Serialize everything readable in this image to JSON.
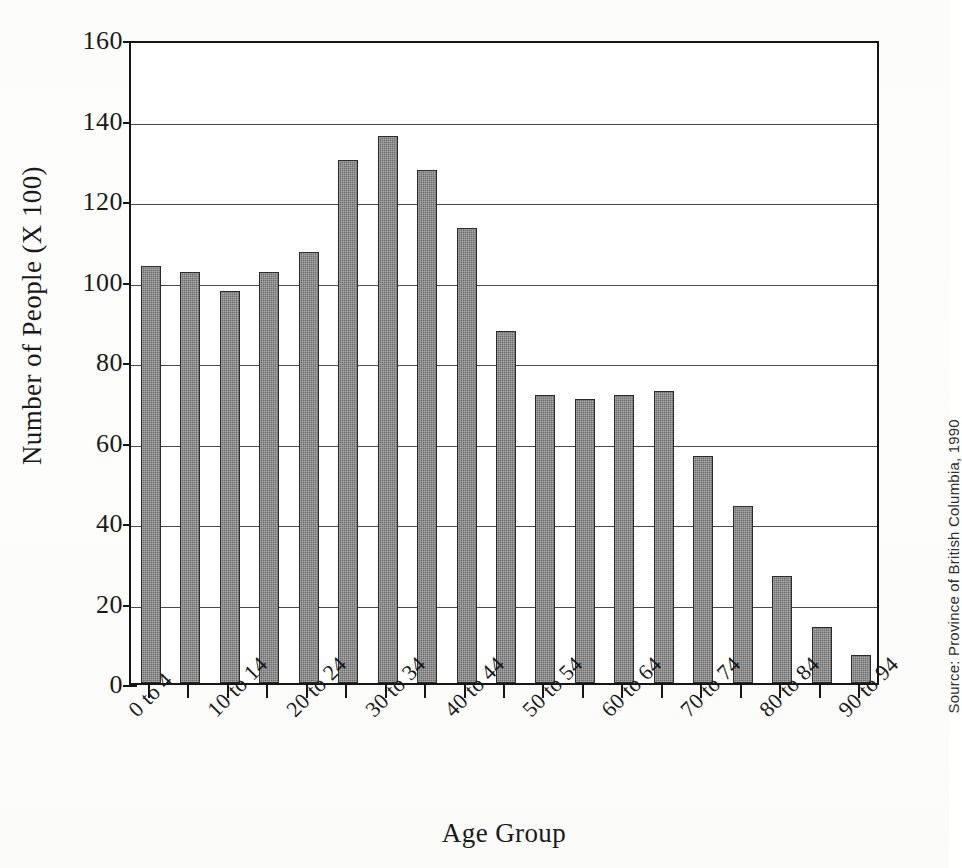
{
  "chart_data": {
    "type": "bar",
    "title": "",
    "xlabel": "Age Group",
    "ylabel": "Number of People (X 100)",
    "ylim": [
      0,
      160
    ],
    "yticks": [
      0,
      20,
      40,
      60,
      80,
      100,
      120,
      140,
      160
    ],
    "ytick_labels": [
      "0",
      "20",
      "40",
      "60",
      "80",
      "100",
      "120",
      "140",
      "160"
    ],
    "grid": true,
    "legend": "none",
    "bar_color": "#6e6e6e",
    "bar_edge_color": "#2b2b2b",
    "axis_color": "#151515",
    "categories": [
      "0 to 4",
      "5 to 9",
      "10 to 14",
      "15 to 19",
      "20 to 24",
      "25 to 29",
      "30 to 34",
      "35 to 39",
      "40 to 44",
      "45 to 49",
      "50 to 54",
      "55 to 59",
      "60 to 64",
      "65 to 69",
      "70 to 74",
      "75 to 79",
      "80 to 84",
      "85 to 89",
      "90 to 94"
    ],
    "values": [
      103.5,
      102,
      97.5,
      102,
      107,
      130,
      136,
      127.5,
      113,
      87.5,
      71.5,
      70.5,
      71.5,
      72.5,
      56.5,
      44,
      26.5,
      14,
      7
    ],
    "xtick_labels_shown": [
      "0 to 4",
      "10 to 14",
      "20 to 24",
      "30 to 34",
      "40 to 44",
      "50 to 54",
      "60 to 64",
      "70 to 74",
      "80 to 84",
      "90 to 94"
    ],
    "xtick_label_indices": [
      0,
      2,
      4,
      6,
      8,
      10,
      12,
      14,
      16,
      18
    ],
    "xtick_label_rotation": -45,
    "annotations": [
      "Source: Province of British Columbia, 1990"
    ]
  },
  "source_note": "Source: Province of British Columbia, 1990"
}
